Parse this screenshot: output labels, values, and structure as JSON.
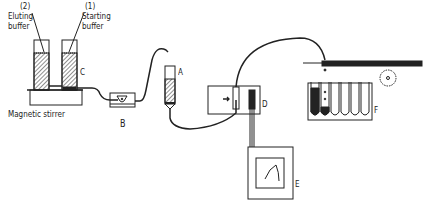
{
  "diagram": {
    "labels": {
      "eluting_number": "(2)",
      "eluting_line1": "Eluting",
      "eluting_line2": "buffer",
      "starting_number": "(1)",
      "starting_line1": "Starting",
      "starting_line2": "buffer",
      "mixer": "C",
      "stirrer": "Magnetic stirrer",
      "pump": "B",
      "column": "A",
      "detector": "D",
      "recorder": "E",
      "fraction_collector": "F"
    },
    "components": [
      {
        "id": "eluting-buffer",
        "label": "(2) Eluting buffer"
      },
      {
        "id": "starting-buffer",
        "label": "(1) Starting buffer"
      },
      {
        "id": "gradient-mixer",
        "label": "C"
      },
      {
        "id": "magnetic-stirrer",
        "label": "Magnetic stirrer"
      },
      {
        "id": "pump",
        "label": "B"
      },
      {
        "id": "column",
        "label": "A"
      },
      {
        "id": "uv-detector",
        "label": "D"
      },
      {
        "id": "chart-recorder",
        "label": "E"
      },
      {
        "id": "fraction-collector",
        "label": "F"
      }
    ],
    "colors": {
      "ink": "#222222",
      "background": "#ffffff"
    }
  }
}
